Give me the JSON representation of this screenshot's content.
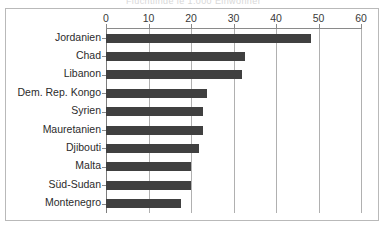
{
  "clipped_top_text": "Flüchtlinge je 1.000 Einwohner",
  "chart_data": {
    "type": "bar",
    "orientation": "horizontal",
    "title": "",
    "subtitle": "",
    "xlabel": "",
    "ylabel": "",
    "xlim": [
      0,
      60
    ],
    "xticks": [
      0,
      10,
      20,
      30,
      40,
      50,
      60
    ],
    "xtick_labels": [
      "0",
      "10",
      "20",
      "30",
      "40",
      "50",
      "60"
    ],
    "grid": true,
    "grid_axis": "x",
    "legend": false,
    "legend_position": "none",
    "bar_color": "#404040",
    "gridline_color": "#b0b0b0",
    "axis_color": "#7d7d7d",
    "frame_color": "#b9b9b9",
    "categories": [
      "Jordanien",
      "Chad",
      "Libanon",
      "Dem. Rep. Kongo",
      "Syrien",
      "Mauretanien",
      "Djibouti",
      "Malta",
      "Süd-Sudan",
      "Montenegro"
    ],
    "values": [
      48.2,
      32.7,
      32.0,
      23.8,
      22.8,
      22.8,
      21.9,
      20.0,
      19.9,
      17.6
    ]
  }
}
